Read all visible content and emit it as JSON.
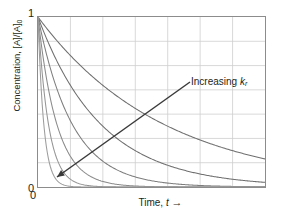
{
  "chart_data": {
    "type": "line",
    "title": "",
    "xlabel": "Time, t",
    "xlabel_text": "Time,",
    "xlabel_var": "t",
    "xlabel_arrow": "→",
    "ylabel_main": "Concentration, [A]/[A]",
    "ylabel_sub": "0",
    "ylabel_full": "Concentration, [A]/[A]0",
    "x_ticks": [
      "0"
    ],
    "y_ticks": [
      "0",
      "1"
    ],
    "y_top_label": "1",
    "y_bottom_label": "0",
    "x_origin_label": "0",
    "xlim": [
      0,
      6
    ],
    "ylim": [
      0,
      1
    ],
    "grid": true,
    "grid_x_lines": 6,
    "grid_y_lines": 6,
    "grid_color": "#cfcfcf",
    "frame_color": "#8c8c8c",
    "legend": "none",
    "annotations": [
      {
        "name": "increasing-rate-constant",
        "text": "Increasing",
        "symbol": "k",
        "subscript": "r",
        "full_text": "Increasing kr",
        "arrow_from_x": 190,
        "arrow_from_y": 82,
        "arrow_to_x": 57,
        "arrow_to_y": 177,
        "color": "#3b3b3b"
      }
    ],
    "series": [
      {
        "name": "k1",
        "k": 0.3,
        "color": "#6e6e6e",
        "x": [
          0,
          0.5,
          1,
          1.5,
          2,
          2.5,
          3,
          3.5,
          4,
          4.5,
          5,
          5.5,
          6
        ],
        "values": [
          1.0,
          0.861,
          0.741,
          0.638,
          0.549,
          0.472,
          0.407,
          0.35,
          0.301,
          0.259,
          0.223,
          0.192,
          0.165
        ]
      },
      {
        "name": "k2",
        "k": 0.6,
        "color": "#6e6e6e",
        "x": [
          0,
          0.5,
          1,
          1.5,
          2,
          2.5,
          3,
          3.5,
          4,
          4.5,
          5,
          5.5,
          6
        ],
        "values": [
          1.0,
          0.741,
          0.549,
          0.407,
          0.301,
          0.223,
          0.165,
          0.122,
          0.091,
          0.067,
          0.05,
          0.037,
          0.027
        ]
      },
      {
        "name": "k3",
        "k": 1.1,
        "color": "#7d7d7d",
        "x": [
          0,
          0.5,
          1,
          1.5,
          2,
          2.5,
          3,
          3.5,
          4,
          4.5,
          5,
          5.5,
          6
        ],
        "values": [
          1.0,
          0.577,
          0.333,
          0.192,
          0.111,
          0.064,
          0.037,
          0.021,
          0.012,
          0.007,
          0.004,
          0.002,
          0.001
        ]
      },
      {
        "name": "k4",
        "k": 2.0,
        "color": "#8a8a8a",
        "x": [
          0,
          0.5,
          1,
          1.5,
          2,
          2.5,
          3,
          3.5,
          4,
          4.5,
          5,
          5.5,
          6
        ],
        "values": [
          1.0,
          0.368,
          0.135,
          0.05,
          0.018,
          0.007,
          0.002,
          0.001,
          0.0,
          0.0,
          0.0,
          0.0,
          0.0
        ]
      },
      {
        "name": "k5",
        "k": 3.6,
        "color": "#949494",
        "x": [
          0,
          0.5,
          1,
          1.5,
          2,
          2.5,
          3,
          3.5,
          4,
          4.5,
          5,
          5.5,
          6
        ],
        "values": [
          1.0,
          0.165,
          0.027,
          0.005,
          0.001,
          0.0,
          0.0,
          0.0,
          0.0,
          0.0,
          0.0,
          0.0,
          0.0
        ]
      },
      {
        "name": "k6",
        "k": 6.5,
        "color": "#9c9c9c",
        "x": [
          0,
          0.5,
          1,
          1.5,
          2,
          2.5,
          3,
          3.5,
          4,
          4.5,
          5,
          5.5,
          6
        ],
        "values": [
          1.0,
          0.039,
          0.002,
          0.0,
          0.0,
          0.0,
          0.0,
          0.0,
          0.0,
          0.0,
          0.0,
          0.0,
          0.0
        ]
      }
    ]
  }
}
